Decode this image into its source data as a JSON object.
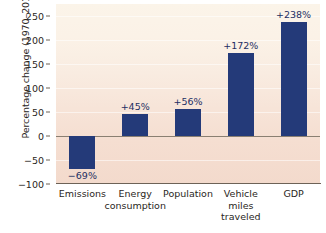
{
  "chart_data": {
    "type": "bar",
    "title": "",
    "subtitle": "",
    "xlabel": "",
    "ylabel": "Percentage change (1970–2014)",
    "categories": [
      "Emissions",
      "Energy consumption",
      "Population",
      "Vehicle miles traveled",
      "GDP"
    ],
    "values": [
      -69,
      45,
      56,
      172,
      238
    ],
    "data_labels": [
      "−69%",
      "+45%",
      "+56%",
      "+172%",
      "+238%"
    ],
    "ylim": [
      -100,
      275
    ],
    "yticks": [
      -100,
      -50,
      0,
      50,
      100,
      150,
      200,
      250
    ],
    "ytick_labels": [
      "−100",
      "−50",
      "0",
      "50",
      "100",
      "150",
      "200",
      "250"
    ],
    "grid": true,
    "legend": null,
    "bar_color": "#243a79",
    "plot_background": "#f7e6d9",
    "axis_color": "#6d6257"
  },
  "axis": {
    "y_title": "Percentage change (1970–2014)"
  },
  "xtick_lines": [
    [
      "Emissions"
    ],
    [
      "Energy",
      "consumption"
    ],
    [
      "Population"
    ],
    [
      "Vehicle",
      "miles",
      "traveled"
    ],
    [
      "GDP"
    ]
  ]
}
